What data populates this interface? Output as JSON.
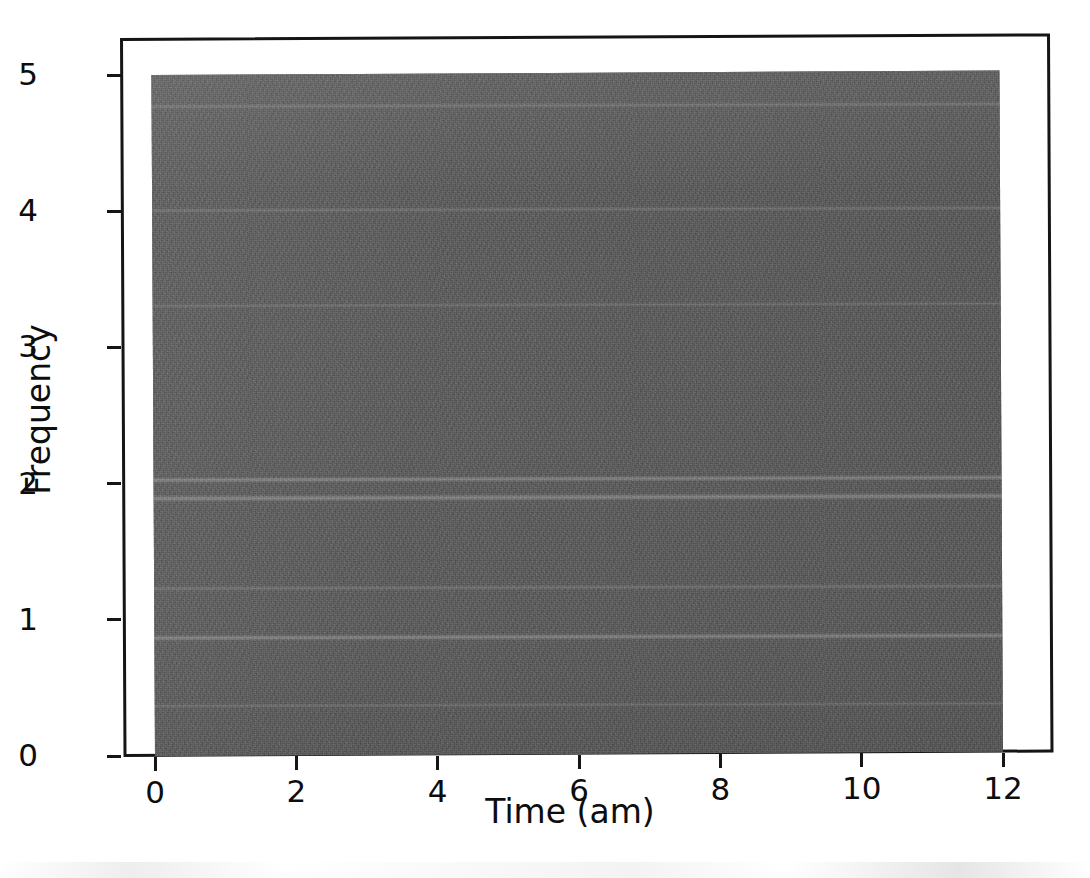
{
  "figure": {
    "background_color": "#ffffff",
    "foreground_color": "#0d0d0d",
    "axes_frame_color": "#151515"
  },
  "axis_titles": {
    "x": "Time (am)",
    "y": "Frequency"
  },
  "chart_data": {
    "type": "heatmap",
    "title": "",
    "subtitle": "",
    "xlabel": "Time (am)",
    "ylabel": "Frequency",
    "xlim": [
      0,
      12
    ],
    "ylim": [
      0,
      5
    ],
    "xticks": [
      0,
      2,
      4,
      6,
      8,
      10,
      12
    ],
    "xticklabels": [
      "0",
      "2",
      "4",
      "6",
      "8",
      "10",
      "12"
    ],
    "yticks": [
      0,
      1,
      2,
      3,
      4,
      5
    ],
    "yticklabels": [
      "0",
      "1",
      "2",
      "3",
      "4",
      "5"
    ],
    "grid": false,
    "legend": null,
    "colormap": "gray",
    "colorbar": false,
    "base_value_color": "#565656",
    "bands": [
      {
        "frequency": 4.76,
        "intensity": "faint",
        "thickness": 5
      },
      {
        "frequency": 4.0,
        "intensity": "faint",
        "thickness": 5
      },
      {
        "frequency": 3.3,
        "intensity": "faint",
        "thickness": 4
      },
      {
        "frequency": 2.02,
        "intensity": "dim",
        "thickness": 6
      },
      {
        "frequency": 1.88,
        "intensity": "dim",
        "thickness": 7
      },
      {
        "frequency": 1.22,
        "intensity": "faint",
        "thickness": 5
      },
      {
        "frequency": 0.86,
        "intensity": "dim",
        "thickness": 6
      },
      {
        "frequency": 0.36,
        "intensity": "faint",
        "thickness": 4
      }
    ]
  }
}
